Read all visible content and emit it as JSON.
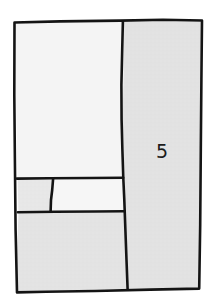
{
  "figure": {
    "kind": "hand-drawn-partition-diagram",
    "title": "",
    "canvas": {
      "width": 213,
      "height": 305
    },
    "background_color": "#ffffff",
    "stroke_color": "#141414",
    "outline": {
      "name": "outer-boundary",
      "path": "M14.5,22.5 L60,21.4 L120,20.6 L163,19.8 L202,20.5 L201.4,80 L200.8,150 L200.2,225 L199.2,288.6 L150,289.6 L95,291 L46,291.8 L17,292.4 L15.6,230 L14.9,160 L14.3,95 Z",
      "stroke_width": 2.6
    },
    "regions": [
      {
        "id": "region-upper-left",
        "label": "",
        "fill": "#f4f4f4",
        "path": "M15.4,23.6 L60,22.5 L120,21.7 L122.6,21.6 L122.2,80 L121.5,120 L121.9,160 L122.3,177.4 L70,178.0 L17.6,178.6 L16.4,120 L15.8,70 Z"
      },
      {
        "id": "region-middle-left-small",
        "label": "",
        "fill": "#e7e7e7",
        "path": "M17.7,179.6 L52.6,179.2 L50.4,211.6 L18.4,212.0 Z"
      },
      {
        "id": "region-middle-center",
        "label": "",
        "fill": "#f6f6f6",
        "path": "M53.6,179.2 L123.0,178.5 L123.6,211.0 L51.4,211.6 Z"
      },
      {
        "id": "region-bottom-left",
        "label": "",
        "fill": "#e3e3e3",
        "path": "M18.5,213.2 L86,212.6 L124.0,212.2 L125.6,250 L127.0,288.8 L80,290.2 L40,291.4 L17.4,291.8 L17.0,250 Z"
      },
      {
        "id": "region-right",
        "label": "5",
        "fill": "#e2e2e2",
        "path": "M123.8,21.5 L163,20.7 L201.2,21.4 L200.6,80 L200.0,150 L199.4,225 L198.5,288.0 L160,288.6 L128.2,288.8 L126.8,250 L125.2,212.0 L124.4,178.4 L124.0,160 L122.6,120 L123.4,80 Z",
        "label_position": {
          "x": 162,
          "y": 152
        },
        "label_font_size": 19
      }
    ],
    "dividers": [
      {
        "id": "divider-vertical-wavy",
        "path": "M122.9,21.2 L122.2,50 L121.4,85 L121.6,120 L122.4,150 L123.3,178.0 L124.3,200 L125.4,230 L126.5,260 L127.6,288.9",
        "stroke_width": 2.6
      },
      {
        "id": "divider-horizontal-upper",
        "path": "M16.8,178.6 L50,178.3 L90,178.0 L123.2,177.8",
        "stroke_width": 2.6
      },
      {
        "id": "divider-horizontal-lower",
        "path": "M17.9,212.3 L55,211.8 L95,211.5 L124.6,211.3",
        "stroke_width": 2.6
      },
      {
        "id": "divider-slanted-small",
        "path": "M53.1,178.9 L52.2,190 L51.0,200 L50.6,211.7",
        "stroke_width": 2.6
      }
    ],
    "label_text": "5"
  }
}
